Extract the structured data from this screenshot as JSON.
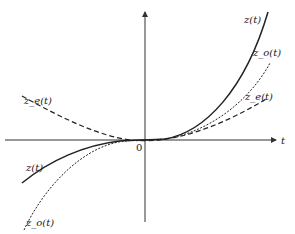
{
  "diagram": {
    "axes": {
      "x_label": "t",
      "origin_label": "0"
    },
    "curves": [
      {
        "name": "z(t)",
        "style": "solid",
        "label": "z(t)",
        "label_left": "z(t)"
      },
      {
        "name": "z_o(t)",
        "style": "dotted",
        "label": "z_o(t)",
        "label_left": "z_o(t)"
      },
      {
        "name": "z_e(t)",
        "style": "dashed",
        "label": "z_e(t)",
        "label_left": "z_e(t)"
      }
    ],
    "colors": {
      "line": "#222222",
      "axis": "#333333"
    }
  }
}
